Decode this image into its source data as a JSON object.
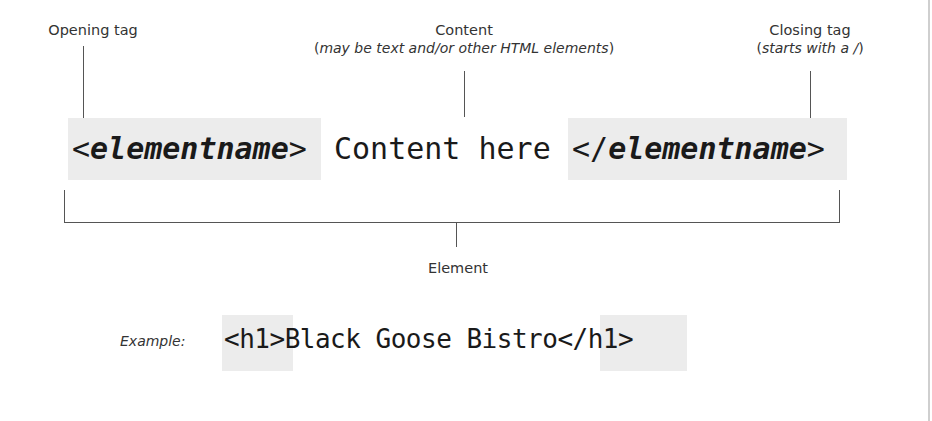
{
  "diagram": {
    "opening_tag": {
      "title": "Opening tag",
      "code_open": "<",
      "code_name": "elementname",
      "code_close": ">"
    },
    "content": {
      "title": "Content",
      "subtitle_open": "(",
      "subtitle_italic": "may be text and/or other HTML elements",
      "subtitle_close": ")",
      "code_text": "Content here"
    },
    "closing_tag": {
      "title": "Closing tag",
      "subtitle_open": "(",
      "subtitle_italic": "starts with a /",
      "subtitle_close": ")",
      "code_open": "</",
      "code_name": "elementname",
      "code_close": ">"
    },
    "element": {
      "label": "Element"
    },
    "example": {
      "label": "Example:",
      "open_tag": "<h1>",
      "content": "Black Goose Bistro",
      "close_tag": "</h1>"
    }
  },
  "colors": {
    "tag_highlight": "#ececec",
    "line": "#555555",
    "text": "#1a1a1a"
  }
}
